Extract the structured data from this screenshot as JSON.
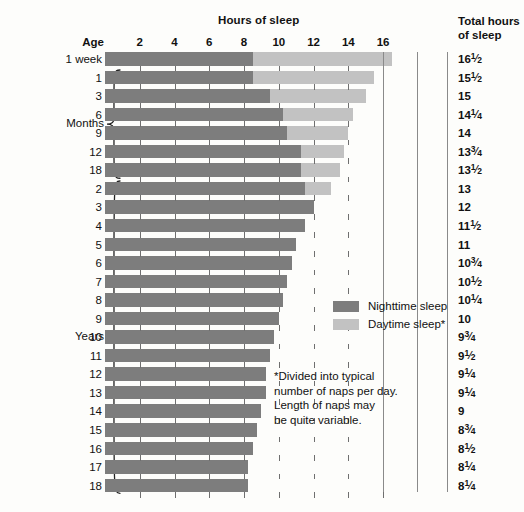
{
  "header": {
    "hours_title": "Hours of sleep",
    "total_title_line1": "Total hours",
    "total_title_line2": "of sleep",
    "age_label": "Age"
  },
  "axis": {
    "ticks": [
      2,
      4,
      6,
      8,
      10,
      12,
      14,
      16
    ],
    "tick_labels": [
      "2",
      "4",
      "6",
      "8",
      "10",
      "12",
      "14",
      "16"
    ],
    "min": 0,
    "max": 17.2
  },
  "groups": [
    {
      "label": "Months",
      "first_row": 1,
      "last_row": 6
    },
    {
      "label": "Years",
      "first_row": 7,
      "last_row": 23
    }
  ],
  "legend": {
    "position": "inside-plot",
    "items": [
      {
        "label": "Nighttime sleep",
        "color": "#7d7d7d",
        "key": "night"
      },
      {
        "label": "Daytime sleep*",
        "color": "#c2c2c2",
        "key": "day"
      }
    ]
  },
  "footnote": {
    "lines": [
      "*Divided into typical",
      "number of naps per day.",
      "Length of naps may",
      "be quite variable."
    ]
  },
  "colors": {
    "night": "#7d7d7d",
    "day": "#c2c2c2",
    "grid": "#6f6f6f",
    "separator": "#8a8a8a",
    "text": "#111111",
    "background": "#fdfdfb"
  },
  "chart_data": {
    "type": "bar",
    "orientation": "horizontal",
    "stacked": true,
    "title": "Hours of sleep",
    "xlabel": "Hours of sleep",
    "ylabel": "Age",
    "xlim": [
      0,
      17.2
    ],
    "grid": true,
    "legend_position": "inside-plot",
    "categories": [
      "1 week",
      "1",
      "3",
      "6",
      "9",
      "12",
      "18",
      "2",
      "3",
      "4",
      "5",
      "6",
      "7",
      "8",
      "9",
      "10",
      "11",
      "12",
      "13",
      "14",
      "15",
      "16",
      "17",
      "18"
    ],
    "category_units": [
      "weeks",
      "months",
      "months",
      "months",
      "months",
      "months",
      "months",
      "years",
      "years",
      "years",
      "years",
      "years",
      "years",
      "years",
      "years",
      "years",
      "years",
      "years",
      "years",
      "years",
      "years",
      "years",
      "years",
      "years"
    ],
    "series": [
      {
        "name": "Nighttime sleep",
        "color": "#7d7d7d",
        "values": [
          8.5,
          8.5,
          9.5,
          10.25,
          10.5,
          11.25,
          11.25,
          11.5,
          12,
          11.5,
          11,
          10.75,
          10.5,
          10.25,
          10,
          9.75,
          9.5,
          9.25,
          9.25,
          9,
          8.75,
          8.5,
          8.25,
          8.25
        ]
      },
      {
        "name": "Daytime sleep*",
        "color": "#c2c2c2",
        "values": [
          8,
          7,
          5.5,
          4,
          3.5,
          2.5,
          2.25,
          1.5,
          0,
          0,
          0,
          0,
          0,
          0,
          0,
          0,
          0,
          0,
          0,
          0,
          0,
          0,
          0,
          0
        ]
      }
    ],
    "totals": [
      16.5,
      15.5,
      15,
      14.25,
      14,
      13.75,
      13.5,
      13,
      12,
      11.5,
      11,
      10.75,
      10.5,
      10.25,
      10,
      9.75,
      9.5,
      9.25,
      9.25,
      9,
      8.75,
      8.5,
      8.25,
      8.25
    ],
    "total_labels": [
      "16½",
      "15½",
      "15",
      "14¼",
      "14",
      "13¾",
      "13½",
      "13",
      "12",
      "11½",
      "11",
      "10¾",
      "10½",
      "10¼",
      "10",
      "9¾",
      "9½",
      "9¼",
      "9¼",
      "9",
      "8¾",
      "8½",
      "8¼",
      "8¼"
    ],
    "annotations": [
      "*Divided into typical number of naps per day. Length of naps may be quite variable."
    ]
  },
  "rows": [
    {
      "age": "1 week",
      "night": 8.5,
      "day": 8.0,
      "total": "16",
      "frac_num": "1",
      "frac_den": "2"
    },
    {
      "age": "1",
      "night": 8.5,
      "day": 7.0,
      "total": "15",
      "frac_num": "1",
      "frac_den": "2"
    },
    {
      "age": "3",
      "night": 9.5,
      "day": 5.5,
      "total": "15",
      "frac_num": "",
      "frac_den": ""
    },
    {
      "age": "6",
      "night": 10.25,
      "day": 4.0,
      "total": "14",
      "frac_num": "1",
      "frac_den": "4"
    },
    {
      "age": "9",
      "night": 10.5,
      "day": 3.5,
      "total": "14",
      "frac_num": "",
      "frac_den": ""
    },
    {
      "age": "12",
      "night": 11.25,
      "day": 2.5,
      "total": "13",
      "frac_num": "3",
      "frac_den": "4"
    },
    {
      "age": "18",
      "night": 11.25,
      "day": 2.25,
      "total": "13",
      "frac_num": "1",
      "frac_den": "2"
    },
    {
      "age": "2",
      "night": 11.5,
      "day": 1.5,
      "total": "13",
      "frac_num": "",
      "frac_den": ""
    },
    {
      "age": "3",
      "night": 12.0,
      "day": 0,
      "total": "12",
      "frac_num": "",
      "frac_den": ""
    },
    {
      "age": "4",
      "night": 11.5,
      "day": 0,
      "total": "11",
      "frac_num": "1",
      "frac_den": "2"
    },
    {
      "age": "5",
      "night": 11.0,
      "day": 0,
      "total": "11",
      "frac_num": "",
      "frac_den": ""
    },
    {
      "age": "6",
      "night": 10.75,
      "day": 0,
      "total": "10",
      "frac_num": "3",
      "frac_den": "4"
    },
    {
      "age": "7",
      "night": 10.5,
      "day": 0,
      "total": "10",
      "frac_num": "1",
      "frac_den": "2"
    },
    {
      "age": "8",
      "night": 10.25,
      "day": 0,
      "total": "10",
      "frac_num": "1",
      "frac_den": "4"
    },
    {
      "age": "9",
      "night": 10.0,
      "day": 0,
      "total": "10",
      "frac_num": "",
      "frac_den": ""
    },
    {
      "age": "10",
      "night": 9.75,
      "day": 0,
      "total": "9",
      "frac_num": "3",
      "frac_den": "4"
    },
    {
      "age": "11",
      "night": 9.5,
      "day": 0,
      "total": "9",
      "frac_num": "1",
      "frac_den": "2"
    },
    {
      "age": "12",
      "night": 9.25,
      "day": 0,
      "total": "9",
      "frac_num": "1",
      "frac_den": "4"
    },
    {
      "age": "13",
      "night": 9.25,
      "day": 0,
      "total": "9",
      "frac_num": "1",
      "frac_den": "4"
    },
    {
      "age": "14",
      "night": 9.0,
      "day": 0,
      "total": "9",
      "frac_num": "",
      "frac_den": ""
    },
    {
      "age": "15",
      "night": 8.75,
      "day": 0,
      "total": "8",
      "frac_num": "3",
      "frac_den": "4"
    },
    {
      "age": "16",
      "night": 8.5,
      "day": 0,
      "total": "8",
      "frac_num": "1",
      "frac_den": "2"
    },
    {
      "age": "17",
      "night": 8.25,
      "day": 0,
      "total": "8",
      "frac_num": "1",
      "frac_den": "4"
    },
    {
      "age": "18",
      "night": 8.25,
      "day": 0,
      "total": "8",
      "frac_num": "1",
      "frac_den": "4"
    }
  ]
}
